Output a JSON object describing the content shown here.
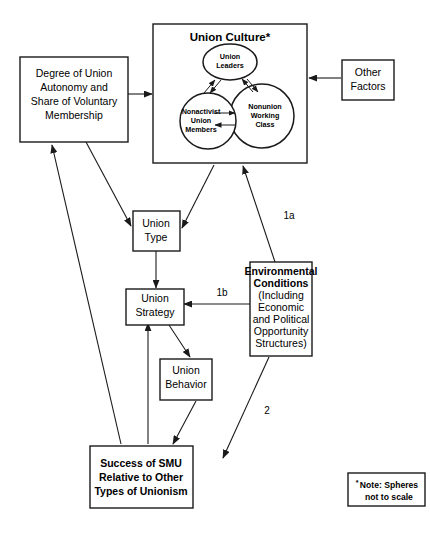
{
  "diagram": {
    "boxes": {
      "union_culture": {
        "label": "Union Culture*",
        "spheres": [
          {
            "id": "union-leaders",
            "lines": [
              "Union",
              "Leaders"
            ]
          },
          {
            "id": "nonactivist-union-members",
            "lines": [
              "Nonactivist",
              "Union",
              "Members"
            ]
          },
          {
            "id": "nonunion-working-class",
            "lines": [
              "Nonunion",
              "Working",
              "Class"
            ]
          }
        ]
      },
      "degree_of_union_autonomy": {
        "lines": [
          "Degree of Union",
          "Autonomy and",
          "Share of Voluntary",
          "Membership"
        ]
      },
      "other_factors": {
        "lines": [
          "Other",
          "Factors"
        ]
      },
      "union_type": {
        "lines": [
          "Union",
          "Type"
        ]
      },
      "union_strategy": {
        "lines": [
          "Union",
          "Strategy"
        ]
      },
      "union_behavior": {
        "lines": [
          "Union",
          "Behavior"
        ]
      },
      "environmental_conditions": {
        "bold_lines": [
          "Environmental",
          "Conditions"
        ],
        "plain_lines": [
          "(Including",
          "Economic",
          "and Political",
          "Opportunity",
          "Structures)"
        ]
      },
      "success_of_smu": {
        "lines": [
          "Success of SMU",
          "Relative to Other",
          "Types of Unionism"
        ]
      },
      "note": {
        "star": "*",
        "lines": [
          "Note: Spheres",
          "not to scale"
        ]
      }
    },
    "edge_labels": {
      "one_a": "1a",
      "one_b": "1b",
      "two": "2"
    },
    "colors": {
      "stroke": "#1a1a1a",
      "background": "#ffffff",
      "text": "#000000"
    }
  }
}
